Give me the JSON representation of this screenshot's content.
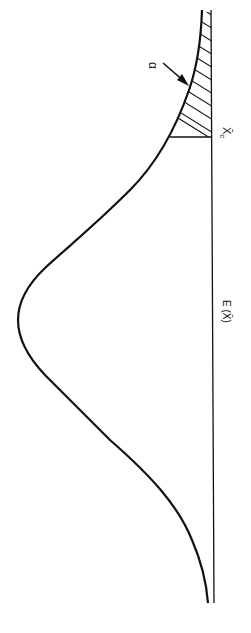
{
  "figure": {
    "orientation": "rotated 90° clockwise (baseline on right, curve peak toward left)",
    "curve": "normal distribution density",
    "labels": {
      "alpha": "α",
      "critical_value": "X̄",
      "critical_sub": "c",
      "mean": "E (X̄)"
    },
    "shaded_region": "right tail beyond X̄c, hatched, area = α",
    "colors": {
      "ink": "#111111",
      "background": "#ffffff"
    }
  }
}
